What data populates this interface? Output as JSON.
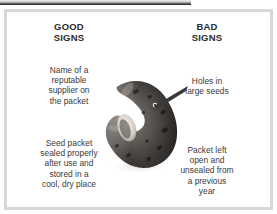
{
  "figure": {
    "columns": [
      {
        "id": "good",
        "heading": "GOOD\nSIGNS",
        "notes": [
          "Name of a\nreputable\nsupplier on\nthe packet",
          "Seed packet\nsealed properly\nafter use and\nstored in a\ncool, dry place"
        ]
      },
      {
        "id": "bad",
        "heading": "BAD\nSIGNS",
        "notes": [
          "Holes in\nlarge seeds",
          "Packet left\nopen and\nunsealed from\na previous\nyear"
        ]
      }
    ],
    "illustration": {
      "name": "kidney-bean-seed",
      "pointer_target": "hole in seed"
    },
    "colors": {
      "frame": "#d5d7d9",
      "heading_text": "#2b2b2b",
      "body_text": "#3a3a3a",
      "background": "#ffffff",
      "bean_dark": "#1d1a18",
      "bean_mid": "#55504c",
      "bean_light": "#b9b3ad",
      "hilum": "#e8e4df",
      "top_bar_dark": "#222222"
    }
  }
}
